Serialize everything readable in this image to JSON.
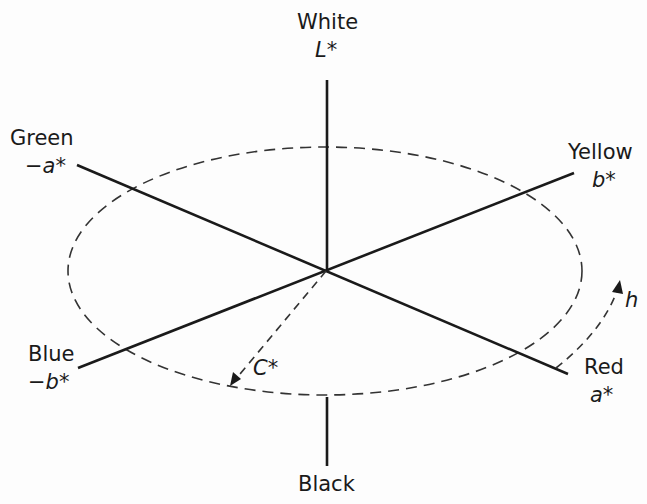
{
  "diagram": {
    "axes": {
      "lightness": {
        "top_label": "White",
        "top_symbol": "L*",
        "bottom_label": "Black"
      },
      "a_axis": {
        "negative_label": "Green",
        "negative_symbol": "−a*",
        "positive_label": "Red",
        "positive_symbol": "a*"
      },
      "b_axis": {
        "positive_label": "Yellow",
        "positive_symbol": "b*",
        "negative_label": "Blue",
        "negative_symbol": "−b*"
      }
    },
    "chroma_label": "C*",
    "hue_label": "h",
    "colors": {
      "line": "#1a1a1a",
      "dashed": "#333333",
      "background": "#fdfdfd"
    }
  }
}
